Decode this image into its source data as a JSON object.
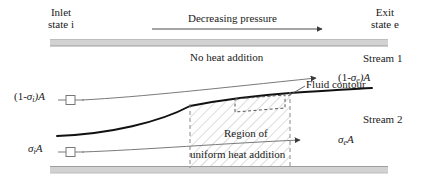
{
  "figure": {
    "type": "fluid-duct-schematic",
    "title_top_left": {
      "line1": "Inlet",
      "line2": "state i"
    },
    "title_top_right": {
      "line1": "Exit",
      "line2": "state e"
    },
    "pressure_arrow_label": "Decreasing pressure",
    "no_heat_label": "No heat addition",
    "stream1_label": "Stream 1",
    "stream2_label": "Stream 2",
    "fluid_contour_label": "Fluid contour",
    "region_label_line1": "Region of",
    "region_label_line2": "uniform heat addition",
    "inlet_area_upper": {
      "pre": "(1-",
      "sym": "σ",
      "sub": "i",
      "post": ")A"
    },
    "inlet_area_lower": {
      "pre": "",
      "sym": "σ",
      "sub": "i",
      "post": "A"
    },
    "exit_area_upper": {
      "pre": "(1-",
      "sym": "σ",
      "sub": "e",
      "post": ")A"
    },
    "exit_area_lower": {
      "pre": "",
      "sym": "σ",
      "sub": "e",
      "post": "A"
    }
  },
  "colors": {
    "wall": "#cfcfcf",
    "wall_edge": "#b5b5b5",
    "streamline": "#6d6d6d",
    "interface": "#000000",
    "hatch": "#b9b9b9",
    "dashed": "#8a8a8a",
    "text": "#1a1a1a",
    "background": "#ffffff"
  },
  "geometry": {
    "wall_top_y": 40,
    "wall_bottom_y": 168,
    "wall_x_start": 50,
    "wall_x_end": 388,
    "heat_region_x_start": 190,
    "heat_region_x_end": 290
  }
}
